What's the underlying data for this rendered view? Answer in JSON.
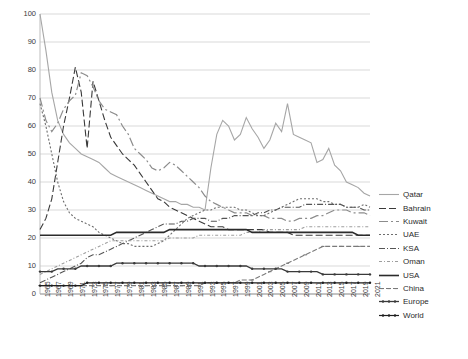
{
  "chart_data": {
    "type": "line",
    "title": "",
    "xlabel": "",
    "ylabel": "",
    "ylim": [
      0,
      100
    ],
    "y_ticks": [
      0,
      10,
      20,
      30,
      40,
      50,
      60,
      70,
      80,
      90,
      100
    ],
    "grid": true,
    "legend_position": "right",
    "x": [
      1965,
      1966,
      1967,
      1968,
      1969,
      1970,
      1971,
      1972,
      1973,
      1974,
      1975,
      1976,
      1977,
      1978,
      1979,
      1980,
      1981,
      1982,
      1983,
      1984,
      1985,
      1986,
      1987,
      1988,
      1989,
      1990,
      1991,
      1992,
      1993,
      1994,
      1995,
      1996,
      1997,
      1998,
      1999,
      2000,
      2001,
      2002,
      2003,
      2004,
      2005,
      2006,
      2007,
      2008,
      2009,
      2010,
      2011,
      2012,
      2013,
      2014,
      2015,
      2016,
      2017,
      2018,
      2019,
      2020,
      2021
    ],
    "x_tick_labels": [
      "1965",
      "1967",
      "1969",
      "1971",
      "1973",
      "1975",
      "1977",
      "1979",
      "1981",
      "1983",
      "1985",
      "1987",
      "1989",
      "1991",
      "1993",
      "1995",
      "1997",
      "1999",
      "2001",
      "2003",
      "2005",
      "2007",
      "2009",
      "2011",
      "2013",
      "2015",
      "2017",
      "2019",
      "2021"
    ],
    "series": [
      {
        "name": "Qatar",
        "color": "#a6a6a6",
        "dash": "none",
        "marker": "none",
        "width": 1.1,
        "values": [
          100,
          87,
          72,
          62,
          57,
          54,
          52,
          50,
          49,
          48,
          47,
          45,
          43,
          42,
          41,
          40,
          39,
          38,
          37,
          36,
          35,
          34,
          33,
          33,
          32,
          32,
          31,
          31,
          30,
          45,
          57,
          62,
          60,
          55,
          57,
          63,
          59,
          56,
          52,
          55,
          61,
          58,
          68,
          57,
          56,
          55,
          54,
          47,
          48,
          52,
          46,
          44,
          40,
          39,
          38,
          36,
          35
        ]
      },
      {
        "name": "Bahrain",
        "color": "#3a3a3a",
        "dash": "7,3",
        "marker": "none",
        "width": 1.1,
        "values": [
          23,
          27,
          34,
          47,
          60,
          70,
          81,
          72,
          52,
          76,
          69,
          62,
          56,
          53,
          50,
          48,
          46,
          43,
          40,
          37,
          34,
          33,
          31,
          30,
          29,
          28,
          27,
          26,
          25,
          24,
          24,
          24,
          23,
          23,
          23,
          23,
          23,
          23,
          23,
          22,
          22,
          22,
          22,
          21,
          21,
          21,
          21,
          21,
          21,
          21,
          21,
          21,
          21,
          21,
          21,
          21,
          21
        ]
      },
      {
        "name": "Kuwait",
        "color": "#8c8c8c",
        "dash": "9,3,2,3",
        "marker": "none",
        "width": 1.2,
        "values": [
          70,
          62,
          58,
          61,
          66,
          69,
          71,
          79,
          78,
          74,
          69,
          66,
          65,
          64,
          60,
          57,
          52,
          50,
          48,
          45,
          44,
          45,
          47,
          46,
          44,
          42,
          40,
          38,
          35,
          33,
          32,
          31,
          30,
          29,
          29,
          29,
          28,
          28,
          28,
          27,
          27,
          27,
          26,
          26,
          27,
          27,
          27,
          28,
          28,
          29,
          30,
          30,
          30,
          29,
          29,
          29,
          28
        ]
      },
      {
        "name": "UAE",
        "color": "#6e6e6e",
        "dash": "2,2",
        "marker": "none",
        "width": 1.1,
        "values": [
          68,
          60,
          50,
          40,
          33,
          29,
          27,
          26,
          25,
          24,
          22,
          21,
          20,
          19,
          18,
          18,
          17,
          17,
          17,
          17,
          18,
          19,
          21,
          23,
          25,
          27,
          28,
          29,
          30,
          30,
          31,
          31,
          31,
          31,
          30,
          30,
          29,
          28,
          28,
          29,
          30,
          31,
          32,
          33,
          34,
          34,
          34,
          34,
          33,
          33,
          32,
          32,
          31,
          31,
          31,
          32,
          31
        ]
      },
      {
        "name": "KSA",
        "color": "#555555",
        "dash": "6,2,1,2",
        "marker": "none",
        "width": 1.1,
        "values": [
          4,
          5,
          6,
          7,
          8,
          9,
          10,
          11,
          13,
          14,
          14,
          15,
          16,
          17,
          18,
          19,
          20,
          21,
          22,
          23,
          24,
          25,
          25,
          25,
          26,
          26,
          27,
          27,
          27,
          26,
          26,
          27,
          27,
          28,
          28,
          28,
          28,
          29,
          29,
          30,
          30,
          31,
          31,
          31,
          31,
          32,
          32,
          32,
          32,
          32,
          32,
          32,
          31,
          31,
          31,
          30,
          30
        ]
      },
      {
        "name": "Oman",
        "color": "#9e9e9e",
        "dash": "3,2,1,2",
        "marker": "none",
        "width": 1.1,
        "values": [
          7,
          8,
          9,
          10,
          11,
          12,
          13,
          14,
          15,
          16,
          17,
          18,
          19,
          19,
          19,
          19,
          19,
          19,
          19,
          19,
          19,
          19,
          20,
          20,
          20,
          20,
          20,
          21,
          21,
          21,
          21,
          21,
          21,
          21,
          21,
          22,
          22,
          22,
          23,
          23,
          23,
          23,
          23,
          23,
          23,
          24,
          24,
          24,
          24,
          24,
          24,
          24,
          24,
          24,
          24,
          24,
          24
        ]
      },
      {
        "name": "USA",
        "color": "#2b2b2b",
        "dash": "none",
        "marker": "none",
        "width": 1.6,
        "values": [
          21,
          21,
          21,
          21,
          21,
          21,
          21,
          21,
          21,
          21,
          21,
          21,
          21,
          22,
          22,
          22,
          22,
          22,
          22,
          22,
          22,
          22,
          23,
          23,
          23,
          23,
          23,
          23,
          23,
          23,
          23,
          23,
          23,
          23,
          23,
          23,
          22,
          22,
          22,
          22,
          22,
          22,
          22,
          22,
          22,
          22,
          22,
          22,
          22,
          22,
          22,
          22,
          22,
          22,
          21,
          21,
          21
        ]
      },
      {
        "name": "China",
        "color": "#7a7a7a",
        "dash": "5,2",
        "marker": "dash",
        "width": 1.1,
        "values": [
          3,
          3,
          3,
          3,
          3,
          3,
          3,
          3,
          3,
          3,
          3,
          3,
          3,
          3,
          3,
          3,
          3,
          3,
          3,
          3,
          3,
          3,
          3,
          3,
          3,
          3,
          3,
          3,
          4,
          4,
          4,
          4,
          4,
          4,
          5,
          5,
          5,
          6,
          7,
          8,
          9,
          10,
          11,
          12,
          13,
          14,
          15,
          16,
          17,
          17,
          17,
          17,
          17,
          17,
          17,
          17,
          17
        ]
      },
      {
        "name": "Europe",
        "color": "#3a3a3a",
        "dash": "none",
        "marker": "dot",
        "width": 1.3,
        "values": [
          8,
          8,
          8,
          9,
          9,
          9,
          9,
          10,
          10,
          10,
          10,
          10,
          10,
          11,
          11,
          11,
          11,
          11,
          11,
          11,
          11,
          11,
          11,
          11,
          11,
          11,
          11,
          10,
          10,
          10,
          10,
          10,
          10,
          10,
          10,
          10,
          9,
          9,
          9,
          9,
          9,
          9,
          8,
          8,
          8,
          8,
          8,
          8,
          7,
          7,
          7,
          7,
          7,
          7,
          7,
          7,
          7
        ]
      },
      {
        "name": "World",
        "color": "#1f1f1f",
        "dash": "none",
        "marker": "dot",
        "width": 1.2,
        "values": [
          3,
          3,
          3,
          3,
          3,
          3,
          3,
          3,
          4,
          4,
          4,
          4,
          4,
          4,
          4,
          4,
          4,
          4,
          4,
          4,
          4,
          4,
          4,
          4,
          4,
          4,
          4,
          4,
          4,
          4,
          4,
          4,
          4,
          4,
          4,
          4,
          4,
          4,
          4,
          4,
          4,
          4,
          4,
          4,
          4,
          4,
          4,
          4,
          4,
          4,
          4,
          4,
          4,
          4,
          4,
          4,
          4
        ]
      }
    ]
  },
  "legend": {
    "items": [
      {
        "label": "Qatar"
      },
      {
        "label": "Bahrain"
      },
      {
        "label": "Kuwait"
      },
      {
        "label": "UAE"
      },
      {
        "label": "KSA"
      },
      {
        "label": "Oman"
      },
      {
        "label": "USA"
      },
      {
        "label": "China"
      },
      {
        "label": "Europe"
      },
      {
        "label": "World"
      }
    ]
  }
}
